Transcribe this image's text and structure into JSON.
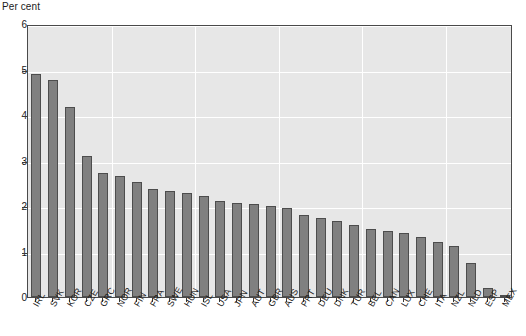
{
  "chart_data": {
    "type": "bar",
    "title": "",
    "subtitle": "",
    "xlabel": "",
    "ylabel": "Per cent",
    "ylim": [
      0,
      6
    ],
    "ytick_values": [
      0,
      1,
      2,
      3,
      4,
      5,
      6
    ],
    "ytick_labels": [
      "0",
      "1",
      "2",
      "3",
      "4",
      "5",
      "6"
    ],
    "grid": true,
    "grid_orientation": "both",
    "legend": false,
    "legend_position": "none",
    "bar_color": "#808080",
    "bar_edge_color": "#4d4d4d",
    "plot_background": "#e7e7e7",
    "gridline_color": "#ffffff",
    "axis_color": "#4a4a4a",
    "categories": [
      "IRL",
      "SVK",
      "KOR",
      "CZE",
      "GRC",
      "NOR",
      "FIN",
      "FRA",
      "SWE",
      "HUN",
      "ISL",
      "USA",
      "JPN",
      "AUT",
      "GBR",
      "AUS",
      "PRT",
      "DEU",
      "DNK",
      "TUR",
      "BEL",
      "CAN",
      "LUX",
      "CHE",
      "ITA",
      "NZL",
      "NLD",
      "ESP",
      "MEX"
    ],
    "values": [
      4.9,
      4.78,
      4.17,
      3.1,
      2.72,
      2.67,
      2.53,
      2.37,
      2.33,
      2.28,
      2.22,
      2.1,
      2.06,
      2.04,
      2.01,
      1.95,
      1.8,
      1.74,
      1.68,
      1.58,
      1.5,
      1.46,
      1.41,
      1.33,
      1.21,
      1.12,
      0.75,
      0.2,
      0.04
    ]
  }
}
